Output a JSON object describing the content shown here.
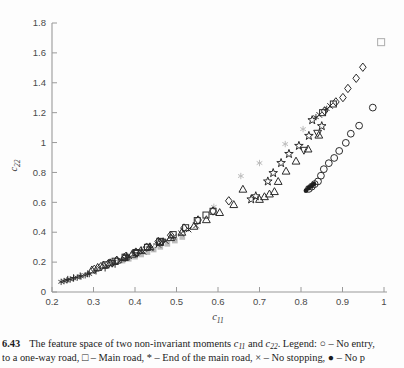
{
  "figure": {
    "number": "6.43",
    "caption": {
      "line1_pre": "The feature space of two non-invariant moments ",
      "var1_base": "c",
      "var1_sub": "11",
      "line1_mid": " and ",
      "var2_base": "c",
      "var2_sub": "22",
      "line1_post": ". Legend: ○ – No entry,",
      "line2": "to a one-way road, □ – Main road, * – End of the main road, × – No stopping, ● – No p"
    }
  },
  "chart_data": {
    "type": "scatter",
    "title": "",
    "xlabel_base": "c",
    "xlabel_sub": "11",
    "ylabel_base": "c",
    "ylabel_sub": "22",
    "xlim": [
      0.2,
      1.0
    ],
    "ylim": [
      0,
      1.8
    ],
    "xticks": [
      "0.2",
      "0.3",
      "0.4",
      "0.5",
      "0.6",
      "0.7",
      "0.8",
      "0.9",
      "1"
    ],
    "yticks": [
      "0",
      "0.2",
      "0.4",
      "0.6",
      "0.8",
      "1",
      "1.2",
      "1.4",
      "1.6",
      "1.8"
    ],
    "grid": false,
    "legend_position": "in-caption",
    "colors": {
      "dark_marker": "#2b2b2b",
      "gray_marker": "#bdbdbd",
      "axis": "#9a9a9a",
      "tick_text": "#4a4a4a"
    },
    "series": [
      {
        "name": "gray-filled-squares",
        "marker": "gray-square",
        "points": [
          [
            0.37,
            0.21
          ],
          [
            0.385,
            0.222
          ],
          [
            0.4,
            0.236
          ],
          [
            0.415,
            0.251
          ],
          [
            0.43,
            0.267
          ],
          [
            0.445,
            0.284
          ],
          [
            0.461,
            0.302
          ],
          [
            0.478,
            0.322
          ],
          [
            0.496,
            0.344
          ],
          [
            0.514,
            0.368
          ]
        ]
      },
      {
        "name": "gray-asterisks",
        "marker": "gray-asterisk",
        "points": [
          [
            0.59,
            0.57
          ],
          [
            0.655,
            0.776
          ],
          [
            0.7,
            0.863
          ],
          [
            0.762,
            0.99
          ],
          [
            0.805,
            1.09
          ]
        ]
      },
      {
        "name": "gray-square-single",
        "marker": "gray-square-outline",
        "points": [
          [
            0.993,
            1.672
          ]
        ]
      },
      {
        "name": "triangles-up",
        "marker": "triangle-up",
        "points": [
          [
            0.296,
            0.148
          ],
          [
            0.31,
            0.165
          ],
          [
            0.324,
            0.18
          ],
          [
            0.34,
            0.196
          ],
          [
            0.356,
            0.213
          ],
          [
            0.374,
            0.232
          ],
          [
            0.393,
            0.253
          ],
          [
            0.414,
            0.277
          ],
          [
            0.436,
            0.303
          ],
          [
            0.46,
            0.332
          ],
          [
            0.486,
            0.364
          ],
          [
            0.513,
            0.4
          ],
          [
            0.542,
            0.44
          ],
          [
            0.572,
            0.484
          ],
          [
            0.604,
            0.532
          ],
          [
            0.638,
            0.585
          ],
          [
            0.66,
            0.688
          ],
          [
            0.7,
            0.62
          ],
          [
            0.712,
            0.638
          ],
          [
            0.724,
            0.656
          ],
          [
            0.736,
            0.672
          ],
          [
            0.745,
            0.74
          ],
          [
            0.764,
            0.809
          ],
          [
            0.788,
            0.876
          ],
          [
            0.817,
            0.957
          ],
          [
            0.843,
            1.05
          ]
        ]
      },
      {
        "name": "triangles-down",
        "marker": "triangle-down",
        "points": [
          [
            0.345,
            0.192
          ],
          [
            0.405,
            0.258
          ],
          [
            0.465,
            0.334
          ],
          [
            0.807,
            0.948
          ],
          [
            0.84,
            1.062
          ]
        ]
      },
      {
        "name": "diamonds",
        "marker": "diamond",
        "points": [
          [
            0.302,
            0.152
          ],
          [
            0.318,
            0.17
          ],
          [
            0.336,
            0.19
          ],
          [
            0.356,
            0.212
          ],
          [
            0.378,
            0.238
          ],
          [
            0.402,
            0.267
          ],
          [
            0.428,
            0.3
          ],
          [
            0.456,
            0.338
          ],
          [
            0.486,
            0.38
          ],
          [
            0.518,
            0.428
          ],
          [
            0.552,
            0.482
          ],
          [
            0.588,
            0.542
          ],
          [
            0.626,
            0.61
          ],
          [
            0.857,
            1.212
          ],
          [
            0.884,
            1.272
          ],
          [
            0.901,
            1.301
          ],
          [
            0.913,
            1.362
          ],
          [
            0.933,
            1.43
          ],
          [
            0.949,
            1.504
          ]
        ]
      },
      {
        "name": "main-road-squares",
        "marker": "square",
        "points": [
          [
            0.33,
            0.182
          ],
          [
            0.352,
            0.206
          ],
          [
            0.376,
            0.233
          ],
          [
            0.402,
            0.264
          ],
          [
            0.43,
            0.299
          ],
          [
            0.46,
            0.339
          ],
          [
            0.492,
            0.384
          ],
          [
            0.522,
            0.43
          ],
          [
            0.55,
            0.478
          ],
          [
            0.571,
            0.515
          ],
          [
            0.588,
            0.54
          ],
          [
            0.852,
            1.2
          ],
          [
            0.878,
            1.258
          ]
        ]
      },
      {
        "name": "end-of-main-road-asterisks",
        "marker": "asterisk",
        "points": [
          [
            0.222,
            0.068
          ],
          [
            0.229,
            0.073
          ],
          [
            0.236,
            0.078
          ],
          [
            0.244,
            0.084
          ],
          [
            0.252,
            0.09
          ],
          [
            0.261,
            0.097
          ],
          [
            0.27,
            0.104
          ],
          [
            0.28,
            0.112
          ],
          [
            0.29,
            0.12
          ],
          [
            0.368,
            0.215
          ],
          [
            0.377,
            0.224
          ],
          [
            0.386,
            0.233
          ],
          [
            0.836,
            1.17
          ],
          [
            0.862,
            1.225
          ]
        ]
      },
      {
        "name": "plus-marks",
        "marker": "plus",
        "points": [
          [
            0.238,
            0.085
          ],
          [
            0.252,
            0.096
          ],
          [
            0.268,
            0.108
          ],
          [
            0.286,
            0.122
          ],
          [
            0.306,
            0.14
          ],
          [
            0.328,
            0.16
          ],
          [
            0.352,
            0.185
          ],
          [
            0.38,
            0.245
          ],
          [
            0.398,
            0.262
          ],
          [
            0.416,
            0.281
          ],
          [
            0.434,
            0.301
          ],
          [
            0.452,
            0.321
          ],
          [
            0.468,
            0.341
          ]
        ]
      },
      {
        "name": "no-stopping-crosses",
        "marker": "cross",
        "points": [
          [
            0.42,
            0.27
          ],
          [
            0.438,
            0.292
          ],
          [
            0.456,
            0.316
          ],
          [
            0.474,
            0.341
          ],
          [
            0.493,
            0.368
          ],
          [
            0.511,
            0.392
          ],
          [
            0.529,
            0.418
          ],
          [
            0.547,
            0.445
          ],
          [
            0.844,
            1.185
          ],
          [
            0.87,
            1.245
          ]
        ]
      },
      {
        "name": "stars",
        "marker": "star",
        "points": [
          [
            0.68,
            0.62
          ],
          [
            0.691,
            0.641
          ],
          [
            0.72,
            0.74
          ],
          [
            0.733,
            0.796
          ],
          [
            0.752,
            0.863
          ],
          [
            0.771,
            0.924
          ],
          [
            0.795,
            0.978
          ],
          [
            0.819,
            1.045
          ],
          [
            0.85,
            1.11
          ],
          [
            0.827,
            1.15
          ]
        ]
      },
      {
        "name": "no-entry-circles",
        "marker": "circle",
        "points": [
          [
            0.819,
            0.69
          ],
          [
            0.826,
            0.705
          ],
          [
            0.833,
            0.722
          ],
          [
            0.841,
            0.74
          ],
          [
            0.848,
            0.778
          ],
          [
            0.855,
            0.822
          ],
          [
            0.867,
            0.862
          ],
          [
            0.88,
            0.897
          ],
          [
            0.892,
            0.944
          ],
          [
            0.908,
            0.998
          ],
          [
            0.92,
            1.059
          ],
          [
            0.94,
            1.113
          ],
          [
            0.973,
            1.234
          ]
        ]
      },
      {
        "name": "no-parking-filled-circles",
        "marker": "filled-circle",
        "points": [
          [
            0.812,
            0.678
          ],
          [
            0.818,
            0.695
          ],
          [
            0.825,
            0.708
          ],
          [
            0.831,
            0.722
          ]
        ]
      }
    ]
  }
}
